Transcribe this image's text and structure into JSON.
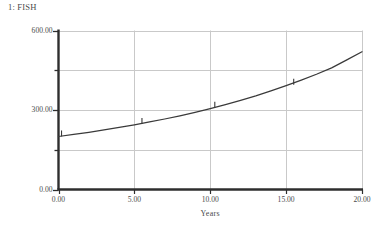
{
  "chart_data": {
    "type": "line",
    "title": "1: FISH",
    "xlabel": "Years",
    "ylabel": "",
    "xlim": [
      0,
      20
    ],
    "ylim": [
      0,
      600
    ],
    "grid": true,
    "legend_position": "none",
    "x_ticks": [
      "0.00",
      "5.00",
      "10.00",
      "15.00",
      "20.00"
    ],
    "x_tick_values": [
      0,
      5,
      10,
      15,
      20
    ],
    "y_ticks": [
      "0.00",
      "300.00",
      "600.00"
    ],
    "y_tick_values": [
      0,
      300,
      600
    ],
    "gridline_y_values": [
      150,
      300,
      450,
      600
    ],
    "gridline_x_values": [
      5,
      10,
      15,
      20
    ],
    "series": [
      {
        "name": "1: FISH",
        "x": [
          0,
          1,
          2,
          3,
          4,
          5,
          6,
          7,
          8,
          9,
          10,
          11,
          12,
          13,
          14,
          15,
          16,
          17,
          18,
          19,
          20
        ],
        "values": [
          200,
          208,
          216,
          225,
          234,
          244,
          255,
          266,
          278,
          291,
          305,
          320,
          336,
          353,
          372,
          392,
          413,
          435,
          459,
          489,
          520
        ],
        "marker_label": "1",
        "marker_x": [
          0.2,
          5.5,
          10.3,
          15.5
        ],
        "marker_y": [
          202,
          249,
          310,
          397
        ]
      }
    ]
  },
  "colors": {
    "axis": "#2e2e2e",
    "grid": "#c9c9c9",
    "line": "#3a3a3a",
    "text": "#4a4a4a",
    "background": "#ffffff"
  }
}
